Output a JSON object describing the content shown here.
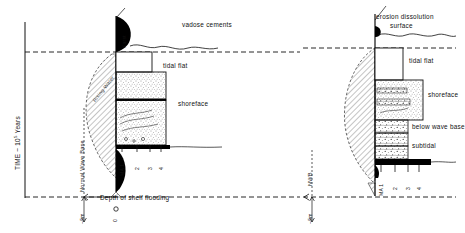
{
  "figure": {
    "type": "geological-sequence-stratigraphy-diagram",
    "axis": {
      "time_label": "TIME ~ 10",
      "time_exponent": "5",
      "time_unit": "Years"
    },
    "panels": [
      {
        "id": "left",
        "top_label": "vadose cements",
        "karst_label": "Karst",
        "flooding_label": "Rising Water",
        "wave_base_label": "Normal Wave Base",
        "depth_label": "Depth of shelf flooding",
        "depth_scale": "~5m",
        "origin_label": "0",
        "facies": [
          {
            "name": "tidal flat"
          },
          {
            "name": "shoreface"
          }
        ],
        "ma_ticks": [
          "MA 1",
          "2",
          "3",
          "4"
        ]
      },
      {
        "id": "right",
        "top_label_line1": "erosion dissolution",
        "top_label_line2": "surface",
        "wave_base_label": "NWB",
        "depth_scale": "~5m",
        "facies": [
          {
            "name": "tidal flat"
          },
          {
            "name": "shoreface"
          },
          {
            "name": "below wave base"
          },
          {
            "name": "subtidal"
          }
        ],
        "ma_ticks": [
          "MA 1",
          "2",
          "3",
          "4"
        ]
      }
    ],
    "colors": {
      "ink": "#111111",
      "fill_black": "#000000",
      "background": "#ffffff"
    }
  }
}
